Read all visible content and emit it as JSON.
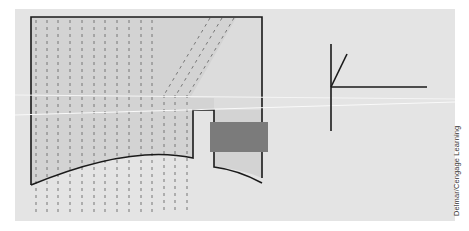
{
  "figure": {
    "colors": {
      "panel": "#e4e4e4",
      "shape_fill": "#d3d3d3",
      "outline": "#1a1a1a",
      "dashes": "#777777",
      "block": "#7b7b7b",
      "scan_line": "#f7f7f7"
    }
  },
  "credit": {
    "text": "Delmar/Cengage Learning"
  }
}
